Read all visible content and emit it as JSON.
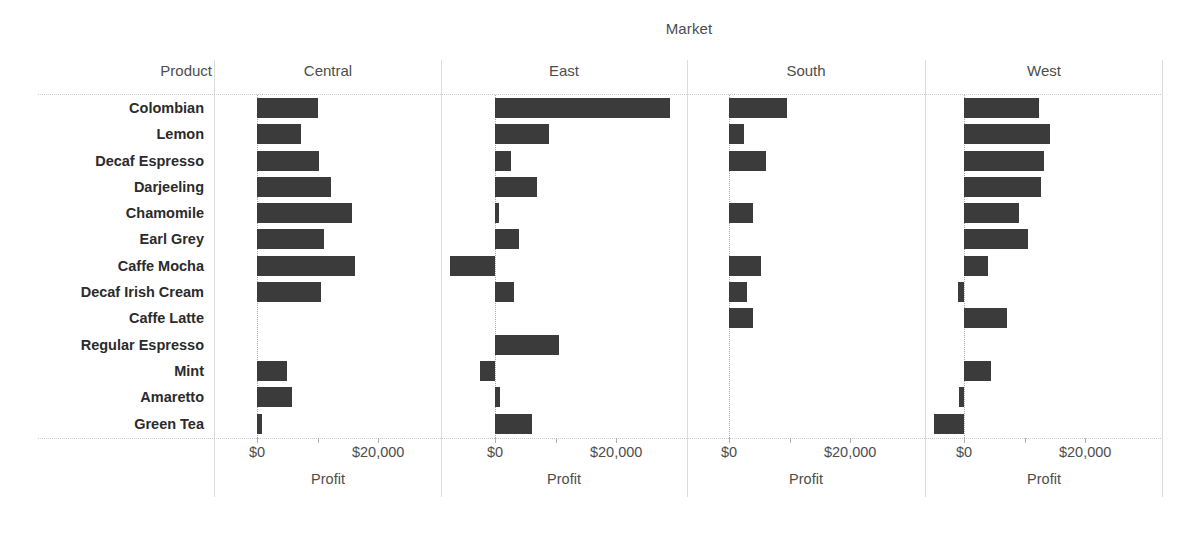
{
  "header": {
    "market_title": "Market",
    "product_header": "Product",
    "panels": [
      "Central",
      "East",
      "South",
      "West"
    ]
  },
  "axis": {
    "title": "Profit",
    "tick_labels": [
      "$0",
      "",
      "$20,000"
    ],
    "tick_values": [
      0,
      10000,
      20000
    ]
  },
  "colors": {
    "bar": "#3b3b3b",
    "gridline": "#c8c8c8",
    "divider": "#dcdcdc",
    "text": "#4d4d4d",
    "label_text": "#2b2b2b"
  },
  "chart_data": {
    "type": "bar",
    "title": "Market",
    "orientation": "horizontal",
    "xlabel": "Profit",
    "ylabel": "Product",
    "xlim": [
      -10000,
      30000
    ],
    "grid": false,
    "legend": "none",
    "facet_field": "Market",
    "facets": [
      "Central",
      "East",
      "South",
      "West"
    ],
    "categories": [
      "Colombian",
      "Lemon",
      "Decaf Espresso",
      "Darjeeling",
      "Chamomile",
      "Earl Grey",
      "Caffe Mocha",
      "Decaf Irish Cream",
      "Caffe Latte",
      "Regular Espresso",
      "Mint",
      "Amaretto",
      "Green Tea"
    ],
    "series": [
      {
        "name": "Central",
        "values": [
          10000,
          7200,
          10300,
          12200,
          15700,
          11000,
          16100,
          10500,
          0,
          0,
          5000,
          5800,
          800
        ]
      },
      {
        "name": "East",
        "values": [
          28800,
          8900,
          2600,
          7000,
          700,
          4000,
          -7500,
          3100,
          0,
          10500,
          -2500,
          800,
          6100
        ]
      },
      {
        "name": "South",
        "values": [
          9500,
          2500,
          6100,
          0,
          4000,
          0,
          5200,
          2900,
          4000,
          0,
          0,
          0,
          0
        ]
      },
      {
        "name": "West",
        "values": [
          12400,
          14200,
          13200,
          12700,
          9000,
          10500,
          4000,
          -1000,
          7100,
          0,
          4500,
          -900,
          -5000
        ]
      }
    ]
  }
}
